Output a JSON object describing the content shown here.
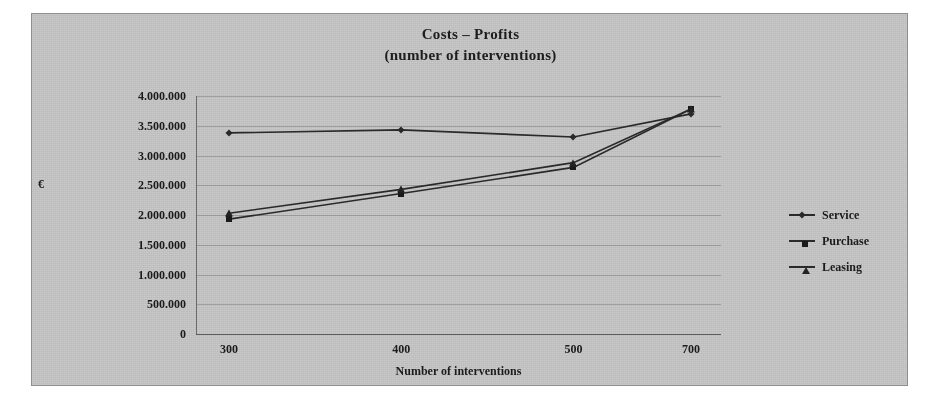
{
  "chart_data": {
    "type": "line",
    "title": "Costs – Profits",
    "subtitle": "(number of interventions)",
    "xlabel": "Number of interventions",
    "ylabel": "€",
    "categories": [
      "300",
      "400",
      "500",
      "700"
    ],
    "x": [
      300,
      400,
      500,
      700
    ],
    "ylim": [
      0,
      4000000
    ],
    "ytick_values": [
      0,
      500000,
      1000000,
      1500000,
      2000000,
      2500000,
      3000000,
      3500000,
      4000000
    ],
    "ytick_labels": [
      "0",
      "500.000",
      "1.000.000",
      "1.500.000",
      "2.000.000",
      "2.500.000",
      "3.000.000",
      "3.500.000",
      "4.000.000"
    ],
    "grid": true,
    "legend_position": "right",
    "series": [
      {
        "name": "Service",
        "marker": "diamond",
        "values": [
          3380000,
          3430000,
          3310000,
          3700000
        ]
      },
      {
        "name": "Purchase",
        "marker": "square",
        "values": [
          1930000,
          2360000,
          2800000,
          3780000
        ]
      },
      {
        "name": "Leasing",
        "marker": "triangle",
        "values": [
          2030000,
          2430000,
          2880000,
          3780000
        ]
      }
    ]
  },
  "figure": {
    "background_color": "#c9c9c9",
    "line_color": "#2b2b2b",
    "grid_color": "#9a9a9a",
    "text_color": "#1c1c1c"
  },
  "legend": {
    "items": [
      {
        "label": "Service",
        "marker": "diamond-marker-icon"
      },
      {
        "label": "Purchase",
        "marker": "square-marker-icon"
      },
      {
        "label": "Leasing",
        "marker": "triangle-marker-icon"
      }
    ]
  }
}
